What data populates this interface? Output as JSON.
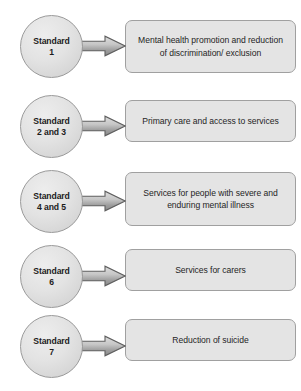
{
  "diagram": {
    "type": "flow",
    "colors": {
      "circle_fill": "#e3e3e3",
      "circle_border": "#9a9a9a",
      "box_fill": "#e4e4e4",
      "box_border": "#a0a0a0",
      "arrow_fill_light": "#d8d8d8",
      "arrow_fill_dark": "#8e8e8e",
      "arrow_border": "#5f5f5f",
      "text": "#1c1c1c",
      "background": "#ffffff"
    },
    "rows": [
      {
        "circle_line1": "Standard",
        "circle_line2": "1",
        "arrow_icon": "right-arrow-icon",
        "box_text": "Mental health promotion and reduction of discrimination/ exclusion"
      },
      {
        "circle_line1": "Standard",
        "circle_line2": "2 and 3",
        "arrow_icon": "right-arrow-icon",
        "box_text": "Primary care and access to services"
      },
      {
        "circle_line1": "Standard",
        "circle_line2": "4 and 5",
        "arrow_icon": "right-arrow-icon",
        "box_text": "Services for people with severe and enduring mental illness"
      },
      {
        "circle_line1": "Standard",
        "circle_line2": "6",
        "arrow_icon": "right-arrow-icon",
        "box_text": "Services for carers"
      },
      {
        "circle_line1": "Standard",
        "circle_line2": "7",
        "arrow_icon": "right-arrow-icon",
        "box_text": "Reduction of suicide"
      }
    ],
    "footer_artifact": ""
  }
}
